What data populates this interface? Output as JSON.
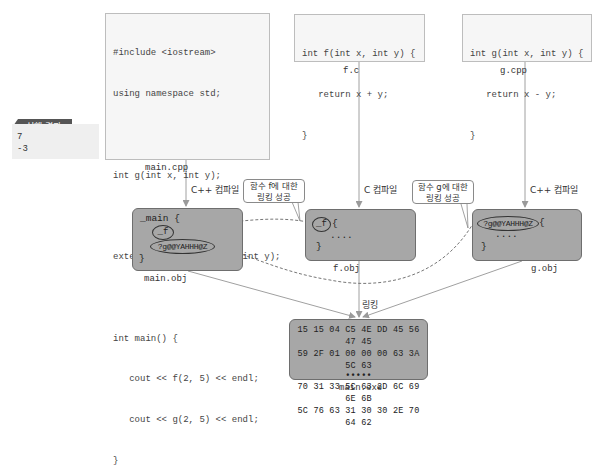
{
  "result": {
    "tag_label": "실행 결과",
    "lines": [
      "7",
      "-3"
    ]
  },
  "sources": {
    "main_cpp": {
      "filename": "main.cpp",
      "lines": [
        "#include <iostream>",
        "using namespace std;",
        "",
        "int g(int x, int y);",
        "",
        "extern \"C\" int f(int x, int y);",
        "",
        "int main() {",
        "   cout << f(2, 5) << endl;",
        "   cout << g(2, 5) << endl;",
        "}"
      ]
    },
    "f_c": {
      "filename": "f.c",
      "lines": [
        "int f(int x, int y) {",
        "   return x + y;",
        "}"
      ]
    },
    "g_cpp": {
      "filename": "g.cpp",
      "lines": [
        "int g(int x, int y) {",
        "   return x - y;",
        "}"
      ]
    }
  },
  "steps": {
    "main_compile": "C++ 컴파일",
    "f_compile": "C 컴파일",
    "g_compile": "C++ 컴파일",
    "linking": "링킹"
  },
  "objects": {
    "main_obj": {
      "filename": "main.obj",
      "line1": "_main {",
      "sym_f": "_f",
      "sym_g": "?g@@YAHHH@Z",
      "close": "}"
    },
    "f_obj": {
      "filename": "f.obj",
      "sym": "_f",
      "open": "{",
      "body": "....",
      "close": "}"
    },
    "g_obj": {
      "filename": "g.obj",
      "sym": "?g@@YAHHH@Z",
      "open": "{",
      "body": "....",
      "close": "}"
    }
  },
  "callouts": {
    "f_link": [
      "함수 f에 대한",
      "링킹 성공"
    ],
    "g_link": [
      "함수 g에 대한",
      "링킹 성공"
    ]
  },
  "executable": {
    "filename": "main.exe",
    "hex_rows": [
      "15 15 04 C5 4E DD 45 56 47 45",
      "59 2F 01 00 00 00 63 3A 5C 63",
      "•••••",
      "70 31 33 5C 63 2D 6C 69 6E 6B",
      "5C 76 63 31 30 30 2E 70 64 62"
    ]
  },
  "colors": {
    "object_fill": "#a7a7a7",
    "object_border": "#6e6e6e",
    "source_fill": "#f6f6f6",
    "source_border": "#bdbdbd",
    "tag_fill": "#555555"
  }
}
